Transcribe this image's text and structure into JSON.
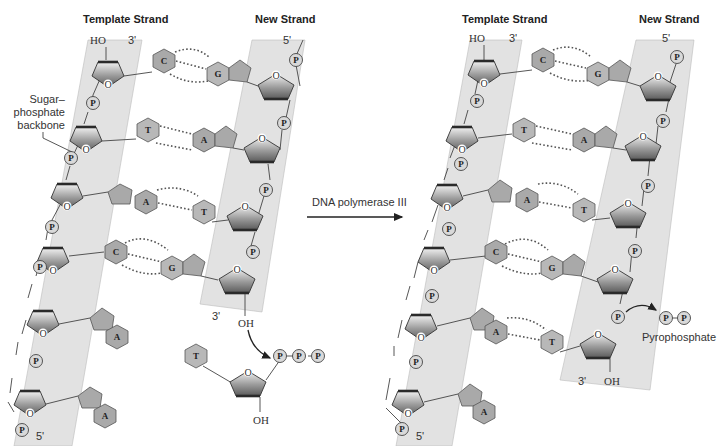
{
  "diagram": {
    "left_panel": {
      "template_strand_label": "Template Strand",
      "new_strand_label": "New Strand",
      "template_top_hydroxyl": "HO",
      "template_top_end": "3'",
      "template_bottom_end": "5'",
      "new_strand_top_end": "5'",
      "new_strand_bottom_end": "3'",
      "new_strand_hydroxyl": "OH",
      "backbone_callout": [
        "Sugar–",
        "phosphate",
        "backbone"
      ],
      "base_pairs": [
        {
          "template": "C",
          "new": "G"
        },
        {
          "template": "T",
          "new": "A"
        },
        {
          "template": "A",
          "new": "T"
        },
        {
          "template": "C",
          "new": "G"
        }
      ],
      "unpaired_template_bases": [
        "A",
        "A"
      ],
      "incoming_nucleotide": {
        "base": "T",
        "phosphates": [
          "P",
          "P",
          "P"
        ],
        "hydroxyl": "OH"
      }
    },
    "arrow": {
      "label": "DNA polymerase III"
    },
    "right_panel": {
      "template_strand_label": "Template Strand",
      "new_strand_label": "New Strand",
      "template_top_hydroxyl": "HO",
      "template_top_end": "3'",
      "template_bottom_end": "5'",
      "new_strand_top_end": "5'",
      "new_strand_bottom_end": "3'",
      "new_strand_hydroxyl": "OH",
      "base_pairs": [
        {
          "template": "C",
          "new": "G"
        },
        {
          "template": "T",
          "new": "A"
        },
        {
          "template": "A",
          "new": "T"
        },
        {
          "template": "C",
          "new": "G"
        },
        {
          "template": "A",
          "new": "T"
        }
      ],
      "unpaired_template_bases": [
        "A"
      ],
      "released_product": {
        "phosphates": [
          "P",
          "P"
        ],
        "label": "Pyrophosphate"
      }
    },
    "symbols": {
      "phosphate": "P",
      "ring_oxygen": "O"
    }
  }
}
